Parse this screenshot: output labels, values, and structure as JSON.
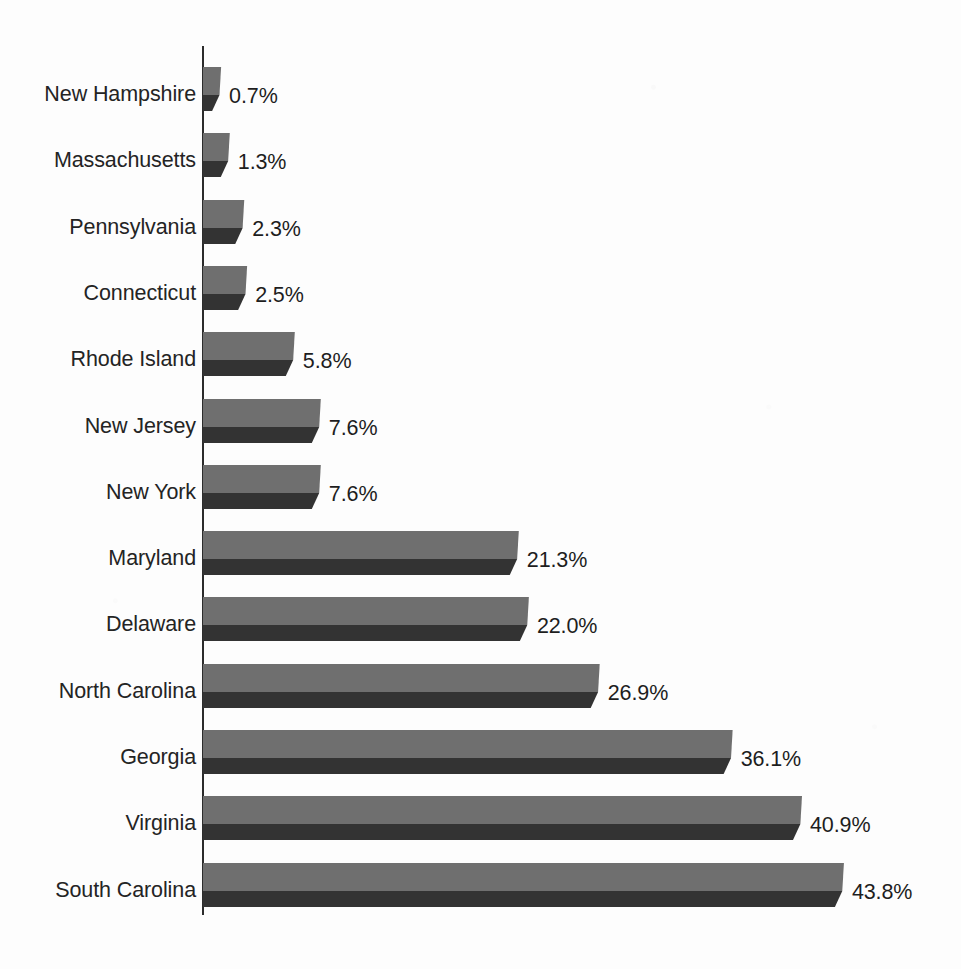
{
  "chart_data": {
    "type": "bar",
    "orientation": "horizontal",
    "title": "",
    "subtitle": "",
    "xlabel": "",
    "ylabel": "",
    "legend": [],
    "legend_position": "none",
    "grid": false,
    "xlim": [
      0,
      43.8
    ],
    "value_suffix": "%",
    "categories": [
      "New Hampshire",
      "Massachusetts",
      "Pennsylvania",
      "Connecticut",
      "Rhode Island",
      "New Jersey",
      "New York",
      "Maryland",
      "Delaware",
      "North Carolina",
      "Georgia",
      "Virginia",
      "South Carolina"
    ],
    "values": [
      0.7,
      1.3,
      2.3,
      2.5,
      5.8,
      7.6,
      7.6,
      21.3,
      22.0,
      26.9,
      36.1,
      40.9,
      43.8
    ],
    "value_labels": [
      "0.7%",
      "1.3%",
      "2.3%",
      "2.5%",
      "5.8%",
      "7.6%",
      "7.6%",
      "21.3%",
      "22.0%",
      "26.9%",
      "36.1%",
      "40.9%",
      "43.8%"
    ],
    "bar_colors": {
      "face": "#6f6f6f",
      "shadow": "#333333",
      "axis": "#2c2c2c",
      "text": "#242424",
      "background": "#fdfdfd"
    }
  }
}
